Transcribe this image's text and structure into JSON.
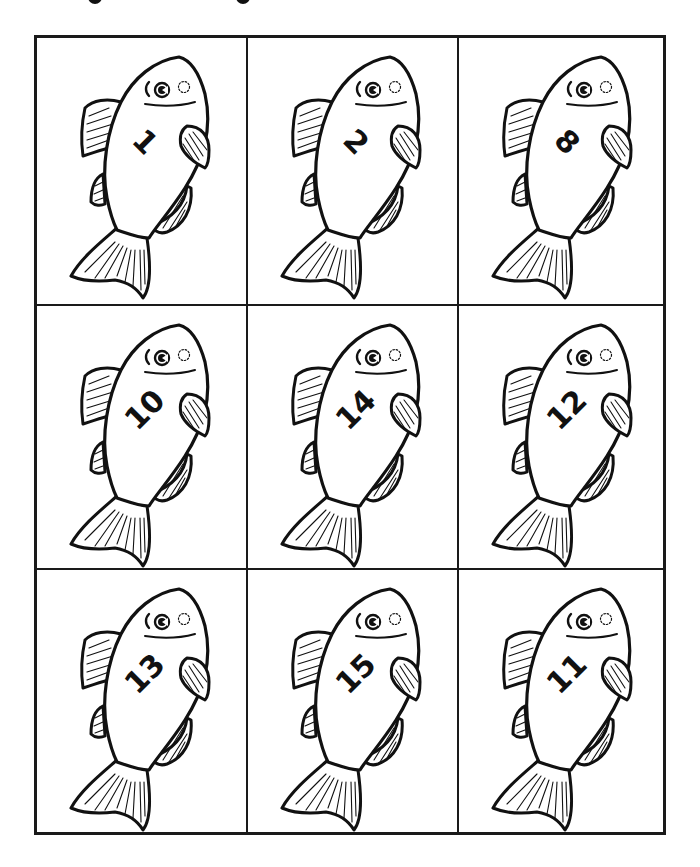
{
  "page": {
    "title_visible": false
  },
  "style": {
    "line_color": "#1a1a1a",
    "background": "#ffffff"
  },
  "grid": {
    "rows": 3,
    "columns": 3,
    "cells": [
      {
        "row": 1,
        "col": 1,
        "number": "1"
      },
      {
        "row": 1,
        "col": 2,
        "number": "2"
      },
      {
        "row": 1,
        "col": 3,
        "number": "8"
      },
      {
        "row": 2,
        "col": 1,
        "number": "10"
      },
      {
        "row": 2,
        "col": 2,
        "number": "14"
      },
      {
        "row": 2,
        "col": 3,
        "number": "12"
      },
      {
        "row": 3,
        "col": 1,
        "number": "13"
      },
      {
        "row": 3,
        "col": 2,
        "number": "15"
      },
      {
        "row": 3,
        "col": 3,
        "number": "11"
      }
    ]
  },
  "icons": {
    "fish": "fish-icon"
  }
}
